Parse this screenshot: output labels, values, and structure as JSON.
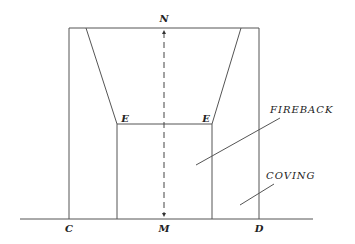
{
  "diagram": {
    "title": "",
    "stroke_color": "#555555",
    "labels": {
      "top": "N",
      "bottom_center": "M",
      "bottom_left": "C",
      "bottom_right": "D",
      "left_corner": "E",
      "right_corner": "E",
      "fireback": "FIREBACK",
      "coving": "COVING"
    },
    "geometry": {
      "ground_line": {
        "x1": 20,
        "x2": 313,
        "y": 219
      },
      "outer_rect": {
        "left": 69,
        "right": 259,
        "top": 28,
        "bottom": 219
      },
      "trapezoid_top": {
        "left": 86,
        "right": 241,
        "y": 28
      },
      "corners_E": {
        "left_x": 117,
        "right_x": 212,
        "y": 124
      },
      "center_dashed_axis": {
        "x": 164,
        "y_top": 30,
        "y_bottom": 217
      },
      "fireback_leader": {
        "x1": 280,
        "y1": 118,
        "x2": 196,
        "y2": 165
      },
      "coving_leader": {
        "x1": 274,
        "y1": 184,
        "x2": 240,
        "y2": 205
      }
    }
  }
}
